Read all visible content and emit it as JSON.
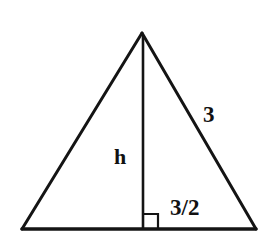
{
  "figure": {
    "background_color": "#ffffff",
    "stroke_color": "#141414",
    "labels": {
      "hypotenuse": "3",
      "height": "h",
      "half_base": "3/2"
    },
    "geometry": {
      "apex": [
        142,
        33
      ],
      "bottom_left": [
        22,
        229
      ],
      "bottom_right": [
        256,
        229
      ],
      "altitude_foot": [
        143,
        229
      ],
      "right_angle_marker": {
        "x": 144,
        "y": 214,
        "size": 14
      },
      "stroke_width_sides": 3,
      "stroke_width_base": 3.5,
      "stroke_width_altitude": 2.6,
      "stroke_width_right_angle": 2.2
    }
  }
}
